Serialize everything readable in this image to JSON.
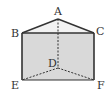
{
  "diagram": {
    "type": "triangular-prism",
    "colors": {
      "fill": "#d9d9d9",
      "stroke": "#333333",
      "background": "#ffffff"
    },
    "vertices": {
      "A": {
        "label": "A",
        "x": 58,
        "y": 19
      },
      "B": {
        "label": "B",
        "x": 22,
        "y": 33
      },
      "C": {
        "label": "C",
        "x": 94,
        "y": 33
      },
      "D": {
        "label": "D",
        "x": 58,
        "y": 68
      },
      "E": {
        "label": "E",
        "x": 22,
        "y": 80
      },
      "F": {
        "label": "F",
        "x": 94,
        "y": 80
      }
    },
    "solid_edges": [
      "AB",
      "AC",
      "BC",
      "BE",
      "CF",
      "EF"
    ],
    "hidden_edges": [
      "AD",
      "DE",
      "DF"
    ]
  }
}
